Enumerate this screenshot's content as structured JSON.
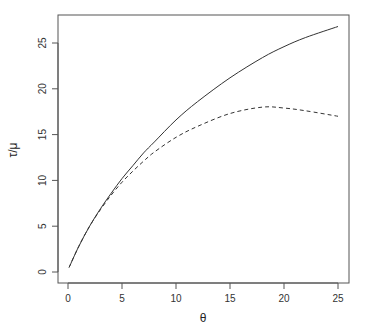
{
  "chart_data": {
    "type": "line",
    "title": "",
    "xlabel": "θ",
    "ylabel": "τ/μ",
    "xlim": [
      0,
      25
    ],
    "ylim": [
      0,
      27
    ],
    "xticks": [
      "0",
      "5",
      "10",
      "15",
      "20",
      "25"
    ],
    "yticks": [
      "0",
      "5",
      "10",
      "15",
      "20",
      "25"
    ],
    "grid": false,
    "legend": null,
    "x": [
      0.1,
      1,
      2,
      3,
      4,
      5,
      6,
      7,
      8,
      10,
      12,
      15,
      18,
      20,
      22,
      25
    ],
    "series": [
      {
        "name": "solid",
        "style": "solid",
        "values": [
          0.5,
          2.8,
          5.0,
          6.9,
          8.6,
          10.2,
          11.6,
          13.0,
          14.2,
          16.6,
          18.6,
          21.2,
          23.4,
          24.6,
          25.6,
          26.8
        ]
      },
      {
        "name": "dashed",
        "style": "dashed",
        "values": [
          0.5,
          2.8,
          5.0,
          6.8,
          8.4,
          9.8,
          11.0,
          12.1,
          13.1,
          14.7,
          15.9,
          17.3,
          18.0,
          17.9,
          17.6,
          17.0
        ]
      }
    ]
  }
}
